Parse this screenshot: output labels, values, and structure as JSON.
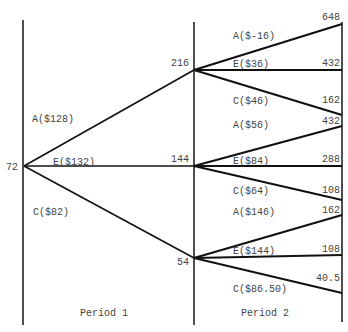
{
  "diagram": {
    "type": "decision-tree",
    "periods": [
      {
        "label": "Period 1"
      },
      {
        "label": "Period 2"
      }
    ],
    "root": {
      "value": "72"
    },
    "period1": {
      "branches": [
        {
          "label": "A($128)",
          "node": "216"
        },
        {
          "label": "E($132)",
          "node": "144"
        },
        {
          "label": "C($82)",
          "node": "54"
        }
      ]
    },
    "period2": {
      "groups": [
        {
          "from": "216",
          "branches": [
            {
              "label": "A($-16)",
              "value": "648"
            },
            {
              "label": "E($36)",
              "value": "432"
            },
            {
              "label": "C($46)",
              "value": "162"
            }
          ]
        },
        {
          "from": "144",
          "branches": [
            {
              "label": "A($56)",
              "value": "432"
            },
            {
              "label": "E($84)",
              "value": "288"
            },
            {
              "label": "C($64)",
              "value": "108"
            }
          ]
        },
        {
          "from": "54",
          "branches": [
            {
              "label": "A($146)",
              "value": "162"
            },
            {
              "label": "E($144)",
              "value": "108"
            },
            {
              "label": "C($86.50)",
              "value": "40.5"
            }
          ]
        }
      ]
    }
  }
}
